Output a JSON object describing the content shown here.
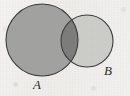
{
  "figure": {
    "kind": "venn-diagram",
    "width": 130,
    "height": 96,
    "background_color": "#f1f0ee"
  },
  "chart_data": {
    "type": "venn",
    "title": "",
    "xlabel": "",
    "ylabel": "",
    "sets": [
      {
        "name": "A",
        "label": "A",
        "cx": 42,
        "cy": 40,
        "r": 36,
        "fill": "#a2a2a0",
        "stroke": "#3a3a3a",
        "label_x": 38,
        "label_y": 90
      },
      {
        "name": "B",
        "label": "B",
        "cx": 87,
        "cy": 41,
        "r": 26,
        "fill": "#cdcdc9",
        "stroke": "#3a3a3a",
        "label_x": 109,
        "label_y": 76
      }
    ],
    "intersection": {
      "name": "A and B",
      "label": "",
      "fill": "#7d7d7b"
    },
    "legend": "none",
    "grid": false
  },
  "labels": {
    "set_a": "A",
    "set_b": "B"
  },
  "colors": {
    "circle_a_fill": "#a2a2a0",
    "circle_b_fill": "#cdcdc9",
    "intersection_fill": "#7d7d7b",
    "outline": "#3a3a3a",
    "label_text": "#2b2b2b",
    "paper": "#f1f0ee"
  }
}
